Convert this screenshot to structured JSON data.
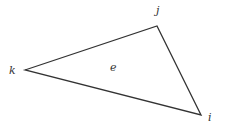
{
  "diagram": {
    "type": "triangle-element",
    "vertices": [
      {
        "id": "k",
        "label": "k",
        "x": 25,
        "y": 70,
        "label_x": 9,
        "label_y": 74
      },
      {
        "id": "j",
        "label": "j",
        "x": 157,
        "y": 26,
        "label_x": 156,
        "label_y": 14
      },
      {
        "id": "i",
        "label": "i",
        "x": 201,
        "y": 115,
        "label_x": 208,
        "label_y": 121
      }
    ],
    "element_label": {
      "text": "e",
      "x": 110,
      "y": 71
    },
    "stroke_color": "#333333"
  }
}
